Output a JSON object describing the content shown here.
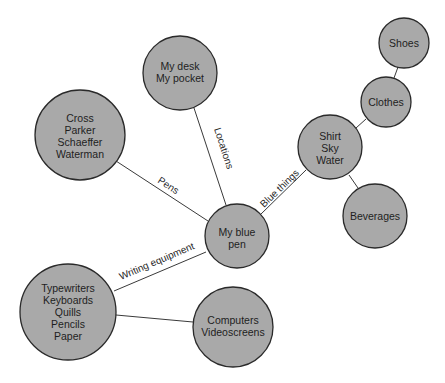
{
  "diagram": {
    "type": "concept-map",
    "center_node": "my-blue-pen",
    "colors": {
      "node_fill": "#a9a9a9",
      "node_stroke": "#2a2a2a",
      "edge": "#3a3a3a",
      "background": "#ffffff"
    },
    "nodes": [
      {
        "id": "my-blue-pen",
        "lines": [
          "My blue pen"
        ],
        "display": [
          "My blue",
          "pen"
        ]
      },
      {
        "id": "locations",
        "lines": [
          "My desk",
          "My pocket"
        ]
      },
      {
        "id": "pens",
        "lines": [
          "Cross",
          "Parker",
          "Schaeffer",
          "Waterman"
        ]
      },
      {
        "id": "blue-things",
        "lines": [
          "Shirt",
          "Sky",
          "Water"
        ]
      },
      {
        "id": "clothes",
        "lines": [
          "Clothes"
        ]
      },
      {
        "id": "shoes",
        "lines": [
          "Shoes"
        ]
      },
      {
        "id": "beverages",
        "lines": [
          "Beverages"
        ]
      },
      {
        "id": "writing-equipment",
        "lines": [
          "Typewriters",
          "Keyboards",
          "Quills",
          "Pencils",
          "Paper"
        ]
      },
      {
        "id": "computers",
        "lines": [
          "Computers",
          "Videoscreens"
        ]
      }
    ],
    "edges": [
      {
        "from": "my-blue-pen",
        "to": "locations",
        "label": "Locations"
      },
      {
        "from": "my-blue-pen",
        "to": "pens",
        "label": "Pens"
      },
      {
        "from": "my-blue-pen",
        "to": "blue-things",
        "label": "Blue things"
      },
      {
        "from": "my-blue-pen",
        "to": "writing-equipment",
        "label": "Writing equipment"
      },
      {
        "from": "blue-things",
        "to": "clothes",
        "label": ""
      },
      {
        "from": "clothes",
        "to": "shoes",
        "label": ""
      },
      {
        "from": "blue-things",
        "to": "beverages",
        "label": ""
      },
      {
        "from": "writing-equipment",
        "to": "computers",
        "label": ""
      }
    ]
  },
  "text": {
    "center_l1": "My blue",
    "center_l2": "pen",
    "loc_l1": "My desk",
    "loc_l2": "My pocket",
    "pens_l1": "Cross",
    "pens_l2": "Parker",
    "pens_l3": "Schaeffer",
    "pens_l4": "Waterman",
    "blue_l1": "Shirt",
    "blue_l2": "Sky",
    "blue_l3": "Water",
    "clothes": "Clothes",
    "shoes": "Shoes",
    "beverages": "Beverages",
    "we_l1": "Typewriters",
    "we_l2": "Keyboards",
    "we_l3": "Quills",
    "we_l4": "Pencils",
    "we_l5": "Paper",
    "comp_l1": "Computers",
    "comp_l2": "Videoscreens",
    "edge_locations": "Locations",
    "edge_pens": "Pens",
    "edge_blue": "Blue things",
    "edge_writing": "Writing equipment"
  }
}
